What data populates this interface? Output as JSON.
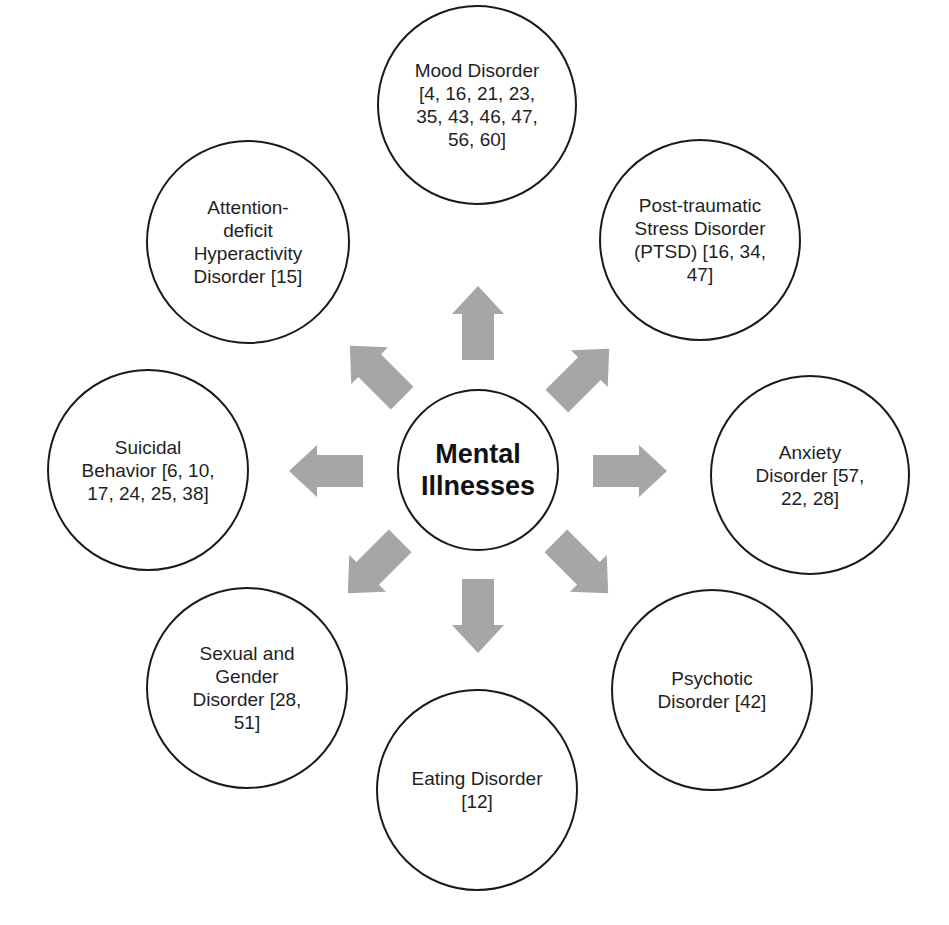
{
  "diagram": {
    "type": "radial-hub",
    "center": {
      "label": "Mental\nIllnesses",
      "cx": 478,
      "cy": 470,
      "r": 81
    },
    "arrow_color": "#a6a6a6",
    "nodes": [
      {
        "id": "mood",
        "label": "Mood Disorder\n[4, 16, 21, 23,\n35, 43, 46, 47,\n56, 60]",
        "cx": 477,
        "cy": 105,
        "r": 100
      },
      {
        "id": "ptsd",
        "label": "Post-traumatic\nStress Disorder\n(PTSD) [16, 34,\n47]",
        "cx": 700,
        "cy": 240,
        "r": 101
      },
      {
        "id": "anxiety",
        "label": "Anxiety\nDisorder [57,\n22, 28]",
        "cx": 810,
        "cy": 475,
        "r": 100
      },
      {
        "id": "psychotic",
        "label": "Psychotic\nDisorder [42]",
        "cx": 712,
        "cy": 690,
        "r": 101
      },
      {
        "id": "eating",
        "label": "Eating Disorder\n[12]",
        "cx": 477,
        "cy": 790,
        "r": 101
      },
      {
        "id": "sexual-gender",
        "label": "Sexual and\nGender\nDisorder [28,\n51]",
        "cx": 247,
        "cy": 688,
        "r": 101
      },
      {
        "id": "suicidal",
        "label": "Suicidal\nBehavior [6, 10,\n17, 24, 25, 38]",
        "cx": 148,
        "cy": 470,
        "r": 101
      },
      {
        "id": "adhd",
        "label": "Attention-\ndeficit\nHyperactivity\nDisorder [15]",
        "cx": 248,
        "cy": 242,
        "r": 102
      }
    ],
    "arrows": [
      {
        "target": "mood",
        "x": 478,
        "y": 323,
        "angle": -90
      },
      {
        "target": "ptsd",
        "x": 583,
        "y": 375,
        "angle": -45
      },
      {
        "target": "anxiety",
        "x": 630,
        "y": 471,
        "angle": 0
      },
      {
        "target": "psychotic",
        "x": 582,
        "y": 567,
        "angle": 45
      },
      {
        "target": "eating",
        "x": 478,
        "y": 616,
        "angle": 90
      },
      {
        "target": "sexual-gender",
        "x": 374,
        "y": 567,
        "angle": 135
      },
      {
        "target": "suicidal",
        "x": 326,
        "y": 471,
        "angle": 180
      },
      {
        "target": "adhd",
        "x": 376,
        "y": 372,
        "angle": -135
      }
    ]
  }
}
